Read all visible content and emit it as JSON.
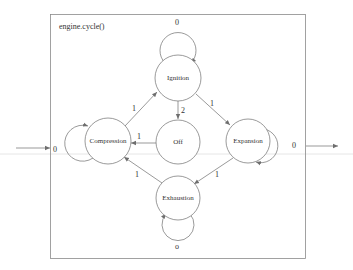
{
  "diagram": {
    "title": "engine.cycle()",
    "type": "state-machine",
    "colors": {
      "stroke": "#6e6e6e",
      "frame": "#8a8a8a",
      "text": "#333333",
      "guide_line": "#e6e6e6",
      "background": "#ffffff"
    },
    "nodes": [
      {
        "id": "ignition",
        "label": "Ignition",
        "self_loop_label": "0"
      },
      {
        "id": "off",
        "label": "Off"
      },
      {
        "id": "compression",
        "label": "Compression",
        "self_loop_label": "0"
      },
      {
        "id": "expansion",
        "label": "Expansion",
        "self_loop_label": "0"
      },
      {
        "id": "exhaustion",
        "label": "Exhaustion",
        "self_loop_label": "o"
      }
    ],
    "edges": [
      {
        "from": "compression",
        "to": "ignition",
        "label": "1"
      },
      {
        "from": "ignition",
        "to": "expansion",
        "label": "1"
      },
      {
        "from": "ignition",
        "to": "off",
        "label": "2"
      },
      {
        "from": "off",
        "to": "compression",
        "label": "1"
      },
      {
        "from": "expansion",
        "to": "exhaustion",
        "label": "1"
      },
      {
        "from": "exhaustion",
        "to": "compression",
        "label": "1"
      },
      {
        "from": "ignition",
        "to": "ignition",
        "label": "0"
      },
      {
        "from": "compression",
        "to": "compression",
        "label": "0"
      },
      {
        "from": "expansion",
        "to": "expansion",
        "label": "0"
      },
      {
        "from": "exhaustion",
        "to": "exhaustion",
        "label": "o"
      }
    ],
    "external": {
      "input_arrow": "left entry into frame",
      "output_arrow": "right exit from frame"
    }
  }
}
